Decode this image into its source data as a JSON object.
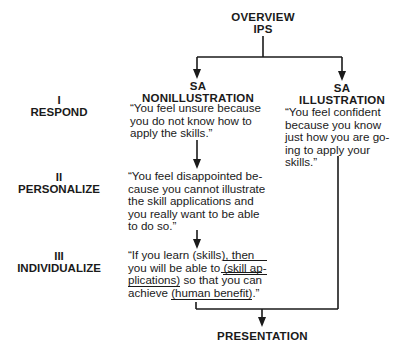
{
  "diagram": {
    "root": {
      "line1": "OVERVIEW",
      "line2": "IPS"
    },
    "stages": [
      {
        "numeral": "I",
        "label": "RESPOND"
      },
      {
        "numeral": "II",
        "label": "PERSONALIZE"
      },
      {
        "numeral": "III",
        "label": "INDIVIDUALIZE"
      }
    ],
    "left_branch": {
      "title_line1": "SA",
      "title_line2": "NONILLUSTRATION",
      "respond_quote": [
        "“You feel unsure because",
        "you do not know how to",
        "apply the skills.”"
      ],
      "personalize_quote": [
        "“You feel disappointed be-",
        "cause you cannot illustrate",
        "the skill applications and",
        "you really want to be able",
        "to do so.”"
      ],
      "individualize_quote": {
        "l1": "“If you learn (skills), then",
        "l2a": "you will be able to ",
        "l2b": "(skill ap-",
        "l3a": "plications)",
        "l3b": " so that ",
        "l3c": "you can",
        "l4a": "achieve ",
        "l4b": "(human benefit)",
        "l4c": ".”"
      }
    },
    "right_branch": {
      "title_line1": "SA",
      "title_line2": "ILLUSTRATION",
      "respond_quote": [
        "“You feel confident",
        "because you know",
        "just how you are go-",
        "ing to apply your",
        "skills.”"
      ]
    },
    "outcome": {
      "label": "PRESENTATION"
    },
    "colors": {
      "ink": "#1a1a1a",
      "background": "#ffffff"
    }
  }
}
